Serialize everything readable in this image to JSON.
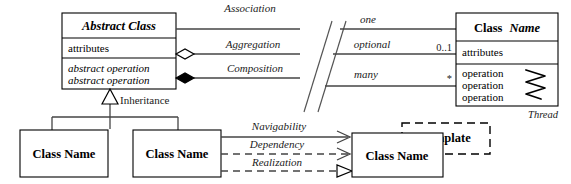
{
  "diagram": {
    "canvas": {
      "width": 571,
      "height": 184
    },
    "colors": {
      "background": "#ffffff",
      "stroke": "#000000",
      "relation_stroke": "#444444"
    }
  },
  "abstract_class": {
    "name": "Abstract Class",
    "attributes": "attributes",
    "operation_1": "abstract operation",
    "operation_2": "abstract operation"
  },
  "right_class": {
    "name_part_1": "Class",
    "name_part_2": "Name",
    "attributes": "attributes",
    "operation_1": "operation",
    "operation_2": "operation",
    "operation_3": "operation",
    "thread_label": "Thread"
  },
  "relations": {
    "association": "Association",
    "aggregation": "Aggregation",
    "composition": "Composition",
    "inheritance": "Inheritance",
    "navigability": "Navigability",
    "dependency": "Dependency",
    "realization": "Realization"
  },
  "multiplicity": {
    "one_label": "one",
    "one_value": "",
    "optional_label": "optional",
    "optional_value": "0..1",
    "many_label": "many",
    "many_value": "*"
  },
  "subclasses": {
    "left": "Class Name",
    "right": "Class Name"
  },
  "template": {
    "stereotype": "Template",
    "class_name": "Class Name"
  }
}
